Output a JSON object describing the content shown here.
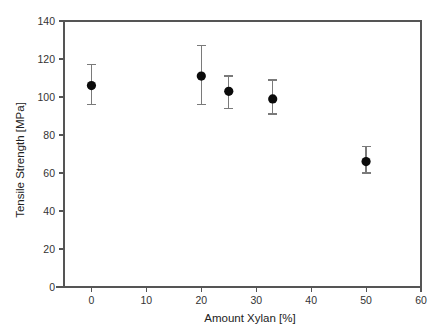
{
  "chart_data": {
    "type": "scatter",
    "title": "",
    "xlabel": "Amount Xylan  [%]",
    "ylabel": "Tensile Strength  [MPa]",
    "xlim": [
      -5,
      60
    ],
    "ylim": [
      0,
      140
    ],
    "xticks": [
      0,
      10,
      20,
      30,
      40,
      50,
      60
    ],
    "xtick_labels": [
      "0",
      "10",
      "20",
      "30",
      "40",
      "50",
      "60"
    ],
    "yticks": [
      0,
      20,
      40,
      60,
      80,
      100,
      120,
      140
    ],
    "ytick_labels": [
      "0",
      "20",
      "40",
      "60",
      "80",
      "100",
      "120",
      "140"
    ],
    "grid": false,
    "legend": false,
    "marker_style": "filled-circle",
    "error_bars": "vertical-capped",
    "x": [
      0,
      20,
      25,
      33,
      50
    ],
    "y": [
      106,
      111,
      103,
      99,
      66
    ],
    "yerr_low": [
      96,
      96,
      94,
      91,
      60
    ],
    "yerr_high": [
      117,
      127,
      111,
      109,
      74
    ],
    "points": [
      {
        "x": 0,
        "y": 106,
        "low": 96,
        "high": 117
      },
      {
        "x": 20,
        "y": 111,
        "low": 96,
        "high": 127
      },
      {
        "x": 25,
        "y": 103,
        "low": 94,
        "high": 111
      },
      {
        "x": 33,
        "y": 99,
        "low": 91,
        "high": 109
      },
      {
        "x": 50,
        "y": 66,
        "low": 60,
        "high": 74
      }
    ],
    "colors": {
      "marker": "#0b0b0b",
      "error_bar": "#7a7a7a",
      "axis": "#555555",
      "text": "#222222",
      "background": "#ffffff"
    }
  }
}
